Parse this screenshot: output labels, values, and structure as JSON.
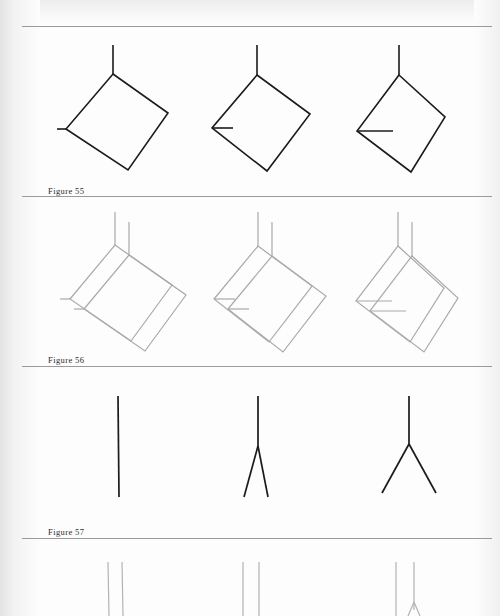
{
  "page": {
    "kind": "scanned-book-page",
    "background_color": "#fdfdfd",
    "ink_color": "#1b1b1b",
    "faint_ink_color": "#a9a9a9",
    "rule_color": "#9a9a9a",
    "width": 500,
    "height": 616
  },
  "rules": [
    {
      "name": "rule-top",
      "y": 26,
      "x1": 22,
      "x2": 492
    },
    {
      "name": "rule-below-figure-55",
      "y": 196,
      "x1": 22,
      "x2": 492
    },
    {
      "name": "rule-below-figure-56",
      "y": 366,
      "x1": 22,
      "x2": 492
    },
    {
      "name": "rule-below-figure-57",
      "y": 538,
      "x1": 22,
      "x2": 492
    }
  ],
  "bands": [
    {
      "id": "band-55",
      "caption": "Figure 55",
      "caption_x": 48,
      "caption_y": 186,
      "top": 26,
      "height": 170,
      "stroke_color": "#1b1b1b",
      "stroke_width": 1.6,
      "description": "Three tilted squares hanging from a vertical stem, each with a progressively longer horizontal stub at the left vertex",
      "shapes": [
        {
          "name": "diamond-1",
          "stem": {
            "x1": 113,
            "y1": 45,
            "x2": 113,
            "y2": 74
          },
          "outline": [
            [
              113,
              74
            ],
            [
              168,
              113
            ],
            [
              128,
              170
            ],
            [
              66,
              129
            ]
          ],
          "stub": {
            "x1": 66,
            "y1": 129,
            "x2": 57,
            "y2": 129
          }
        },
        {
          "name": "diamond-2",
          "stem": {
            "x1": 257,
            "y1": 45,
            "x2": 257,
            "y2": 75
          },
          "outline": [
            [
              257,
              75
            ],
            [
              310,
              114
            ],
            [
              267,
              171
            ],
            [
              212,
              128
            ]
          ],
          "stub": {
            "x1": 212,
            "y1": 128,
            "x2": 233,
            "y2": 128
          }
        },
        {
          "name": "diamond-3",
          "stem": {
            "x1": 399,
            "y1": 45,
            "x2": 399,
            "y2": 75
          },
          "outline": [
            [
              399,
              75
            ],
            [
              445,
              117
            ],
            [
              411,
              172
            ],
            [
              357,
              131
            ]
          ],
          "stub": {
            "x1": 357,
            "y1": 131,
            "x2": 393,
            "y2": 131
          }
        }
      ]
    },
    {
      "id": "band-56",
      "caption": "Figure 56",
      "caption_x": 48,
      "caption_y": 355,
      "top": 196,
      "height": 170,
      "stroke_color": "#a9a9a9",
      "stroke_width": 1.2,
      "description": "The same three figures redrawn as faint doubled outlines, each shape traced twice with a small offset",
      "offset": {
        "dx": 14,
        "dy": 10
      },
      "shapes": [
        {
          "name": "double-diamond-1",
          "stem": {
            "x1": 115,
            "y1": 212,
            "x2": 115,
            "y2": 245
          },
          "outline": [
            [
              115,
              245
            ],
            [
              172,
              285
            ],
            [
              131,
              341
            ],
            [
              70,
              299
            ]
          ],
          "stub": {
            "x1": 70,
            "y1": 299,
            "x2": 60,
            "y2": 299
          }
        },
        {
          "name": "double-diamond-2",
          "stem": {
            "x1": 258,
            "y1": 212,
            "x2": 258,
            "y2": 246
          },
          "outline": [
            [
              258,
              246
            ],
            [
              312,
              286
            ],
            [
              269,
              342
            ],
            [
              214,
              299
            ]
          ],
          "stub": {
            "x1": 214,
            "y1": 299,
            "x2": 235,
            "y2": 299
          }
        },
        {
          "name": "double-diamond-3",
          "stem": {
            "x1": 398,
            "y1": 212,
            "x2": 398,
            "y2": 246
          },
          "outline": [
            [
              398,
              246
            ],
            [
              444,
              288
            ],
            [
              410,
              342
            ],
            [
              356,
              301
            ]
          ],
          "stub": {
            "x1": 356,
            "y1": 301,
            "x2": 392,
            "y2": 301
          }
        }
      ]
    },
    {
      "id": "band-57",
      "caption": "Figure 57",
      "caption_x": 48,
      "caption_y": 527,
      "top": 366,
      "height": 172,
      "stroke_color": "#1b1b1b",
      "stroke_width": 1.7,
      "description": "Three forked-line figures: a single vertical stroke, a narrow Y fork, and a wide Y fork",
      "shapes": [
        {
          "name": "fork-1-straight-line",
          "stem": {
            "x1": 118,
            "y1": 396,
            "x2": 119,
            "y2": 497
          },
          "branches": []
        },
        {
          "name": "fork-2-narrow",
          "stem": {
            "x1": 258,
            "y1": 396,
            "x2": 258,
            "y2": 446
          },
          "branches": [
            {
              "x1": 258,
              "y1": 446,
              "x2": 244,
              "y2": 497
            },
            {
              "x1": 258,
              "y1": 446,
              "x2": 268,
              "y2": 497
            }
          ]
        },
        {
          "name": "fork-3-wide",
          "stem": {
            "x1": 409,
            "y1": 396,
            "x2": 409,
            "y2": 444
          },
          "branches": [
            {
              "x1": 409,
              "y1": 444,
              "x2": 382,
              "y2": 493
            },
            {
              "x1": 409,
              "y1": 444,
              "x2": 436,
              "y2": 493
            }
          ]
        }
      ]
    },
    {
      "id": "band-58-partial",
      "caption": "",
      "top": 538,
      "height": 78,
      "stroke_color": "#b3b3b3",
      "stroke_width": 1.2,
      "description": "Partially visible next band, cut off by the bottom edge: faint doubled vertical strokes matching the figures above",
      "shapes": [
        {
          "name": "double-line-1",
          "lines": [
            {
              "x1": 108,
              "y1": 562,
              "x2": 109,
              "y2": 616
            },
            {
              "x1": 122,
              "y1": 562,
              "x2": 123,
              "y2": 616
            }
          ]
        },
        {
          "name": "double-line-2",
          "lines": [
            {
              "x1": 243,
              "y1": 562,
              "x2": 243,
              "y2": 616
            },
            {
              "x1": 259,
              "y1": 562,
              "x2": 259,
              "y2": 616
            }
          ]
        },
        {
          "name": "double-line-3",
          "lines": [
            {
              "x1": 396,
              "y1": 562,
              "x2": 396,
              "y2": 616
            },
            {
              "x1": 414,
              "y1": 562,
              "x2": 414,
              "y2": 610
            }
          ],
          "fork_hint": [
            {
              "x1": 414,
              "y1": 602,
              "x2": 408,
              "y2": 616
            },
            {
              "x1": 414,
              "y1": 602,
              "x2": 420,
              "y2": 616
            }
          ]
        }
      ]
    }
  ]
}
